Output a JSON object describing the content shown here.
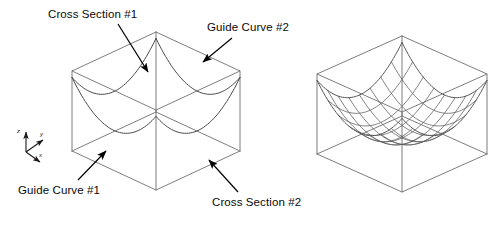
{
  "figure": {
    "title_visible": false,
    "panels": [
      {
        "id": "left",
        "name": "boundary-curve-patch",
        "description": "isometric box with four boundary curves"
      },
      {
        "id": "right",
        "name": "meshed-surface-patch",
        "description": "isometric box with isoparametric surface mesh"
      }
    ]
  },
  "labels": {
    "cross_section_1": "Cross Section #1",
    "guide_curve_2": "Guide Curve #2",
    "guide_curve_1": "Guide Curve #1",
    "cross_section_2": "Cross Section #2"
  },
  "axes": {
    "z": "z",
    "y": "y",
    "x": "x"
  },
  "colors": {
    "background": "#ffffff",
    "box_edge": "#6e6e6e",
    "curve": "#4a4a4a",
    "mesh": "#5a5a5a",
    "text": "#0a0a0a",
    "arrow": "#000000"
  },
  "geometry": {
    "left_box": {
      "cx": 156,
      "cy": 124,
      "half_w": 84,
      "top_y": 32,
      "bot_y": 190,
      "side_h": 80
    },
    "right_box": {
      "cx": 402,
      "cy": 126,
      "half_w": 85,
      "top_y": 36,
      "bot_y": 192,
      "side_h": 80
    },
    "mesh_divisions": 8
  },
  "label_positions": {
    "cross_section_1": {
      "left": 48,
      "top": 8
    },
    "guide_curve_2": {
      "left": 207,
      "top": 21
    },
    "guide_curve_1": {
      "left": 18,
      "top": 184
    },
    "cross_section_2": {
      "left": 212,
      "top": 196
    }
  },
  "arrows": [
    {
      "name": "cross-section-1-arrow",
      "x1": 118,
      "y1": 24,
      "x2": 148,
      "y2": 72
    },
    {
      "name": "guide-curve-2-arrow",
      "x1": 232,
      "y1": 38,
      "x2": 203,
      "y2": 62
    },
    {
      "name": "guide-curve-1-arrow",
      "x1": 78,
      "y1": 180,
      "x2": 106,
      "y2": 151
    },
    {
      "name": "cross-section-2-arrow",
      "x1": 238,
      "y1": 192,
      "x2": 209,
      "y2": 160
    }
  ]
}
